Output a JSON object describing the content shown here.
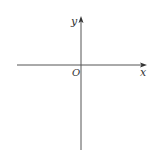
{
  "diagram": {
    "type": "cartesian-axes",
    "labels": {
      "x_axis": "x",
      "y_axis": "y",
      "origin": "O"
    },
    "colors": {
      "axis": "#555555",
      "text": "#333333",
      "background": "#ffffff"
    }
  }
}
